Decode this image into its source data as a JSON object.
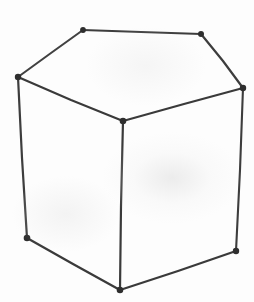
{
  "figure": {
    "style": "hand-drawn pencil / ink line drawing",
    "canvas": {
      "width": 254,
      "height": 302
    },
    "colors": {
      "background": "#fdfdfd",
      "paper_tint": "#ececec",
      "stroke": "#3a3a3a",
      "stroke_light": "#555555",
      "vertex": "#2e2e2e"
    },
    "stroke_width": 2.1,
    "vertices": [
      {
        "id": "top-back-left",
        "name": "top-back-left-vertex",
        "x": 83,
        "y": 30,
        "radius": 2.9
      },
      {
        "id": "top-back-right",
        "name": "top-back-right-vertex",
        "x": 201,
        "y": 34,
        "radius": 3.0
      },
      {
        "id": "top-left",
        "name": "top-left-vertex",
        "x": 18,
        "y": 77,
        "radius": 3.2
      },
      {
        "id": "top-right",
        "name": "top-right-vertex",
        "x": 243,
        "y": 88,
        "radius": 3.2
      },
      {
        "id": "top-front-center",
        "name": "top-front-center-vertex",
        "x": 123,
        "y": 121,
        "radius": 3.3
      },
      {
        "id": "bottom-left",
        "name": "bottom-left-vertex",
        "x": 27,
        "y": 238,
        "radius": 3.3
      },
      {
        "id": "bottom-right",
        "name": "bottom-right-vertex",
        "x": 236,
        "y": 251,
        "radius": 3.2
      },
      {
        "id": "bottom-center",
        "name": "bottom-front-center-vertex",
        "x": 120,
        "y": 290,
        "radius": 3.3
      }
    ],
    "edges": [
      {
        "id": "top-back-edge",
        "name": "top-back-edge",
        "from": "top-back-left",
        "to": "top-back-right",
        "path": "M 83 30 L 201 34"
      },
      {
        "id": "top-left-upper-edge",
        "name": "top-left-upper-edge",
        "from": "top-left",
        "to": "top-back-left",
        "path": "M 18 77 L 83 30"
      },
      {
        "id": "top-right-upper-edge",
        "name": "top-right-upper-edge",
        "from": "top-back-right",
        "to": "top-right",
        "path": "M 201 34 L 243 88"
      },
      {
        "id": "top-left-diagonal",
        "name": "top-left-diagonal-edge",
        "from": "top-left",
        "to": "top-front-center",
        "path": "M 18 77 L 123 121"
      },
      {
        "id": "top-right-diagonal",
        "name": "top-right-diagonal-edge",
        "from": "top-front-center",
        "to": "top-right",
        "path": "M 123 121 L 243 88"
      },
      {
        "id": "left-vertical",
        "name": "left-vertical-edge",
        "from": "top-left",
        "to": "bottom-left",
        "path": "M 18 77 L 27 238"
      },
      {
        "id": "center-vertical",
        "name": "center-vertical-edge",
        "from": "top-front-center",
        "to": "bottom-center",
        "path": "M 123 121 L 120 290"
      },
      {
        "id": "right-vertical",
        "name": "right-vertical-edge",
        "from": "top-right",
        "to": "bottom-right",
        "path": "M 243 88 L 236 251"
      },
      {
        "id": "bottom-left-edge",
        "name": "bottom-left-edge",
        "from": "bottom-left",
        "to": "bottom-center",
        "path": "M 27 238 L 120 290"
      },
      {
        "id": "bottom-right-edge",
        "name": "bottom-right-edge",
        "from": "bottom-center",
        "to": "bottom-right",
        "path": "M 120 290 L 236 251"
      }
    ],
    "faces": [
      {
        "id": "top-face",
        "name": "top-face",
        "label": "top face"
      },
      {
        "id": "left-face",
        "name": "left-face",
        "label": "left face"
      },
      {
        "id": "right-face",
        "name": "right-face",
        "label": "right face"
      }
    ]
  }
}
